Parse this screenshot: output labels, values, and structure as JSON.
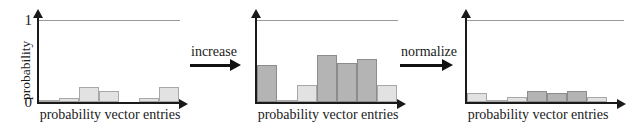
{
  "figure": {
    "title": "",
    "panels": [
      {
        "id": "panel-initial",
        "ylabel": "probability",
        "xlabel": "probability vector entries",
        "yticks": [
          "0",
          "1"
        ],
        "show_ylabel": true,
        "show_yticks": true
      },
      {
        "id": "panel-increased",
        "ylabel": "",
        "xlabel": "probability vector entries",
        "yticks": [],
        "show_ylabel": false,
        "show_yticks": false
      },
      {
        "id": "panel-normalized",
        "ylabel": "",
        "xlabel": "probability vector entries",
        "yticks": [],
        "show_ylabel": false,
        "show_yticks": false
      }
    ],
    "arrows": [
      {
        "id": "arrow-increase",
        "label": "increase"
      },
      {
        "id": "arrow-normalize",
        "label": "normalize"
      }
    ],
    "colors": {
      "bar_light_fill": "#e2e2e2",
      "bar_light_stroke": "#a8a8a8",
      "bar_dark_fill": "#b4b4b4",
      "bar_dark_stroke": "#8c8c8c",
      "axis": "#1a1a1a",
      "guide_line": "#9a9a9a",
      "arrow": "#111111",
      "background": "#ffffff"
    }
  },
  "chart_data": [
    {
      "type": "bar",
      "id": "panel-initial",
      "title": "",
      "xlabel": "probability vector entries",
      "ylabel": "probability",
      "ylim": [
        0,
        1
      ],
      "yticks": [
        0,
        1
      ],
      "ytick_labels": [
        "0",
        "1"
      ],
      "grid": false,
      "guide_line_y": 1,
      "legend": "none",
      "categories": [
        "1",
        "2",
        "3",
        "4",
        "5",
        "6",
        "7"
      ],
      "values": [
        0.03,
        0.05,
        0.18,
        0.13,
        0.0,
        0.05,
        0.18
      ],
      "bar_styles": [
        "light",
        "light",
        "light",
        "light",
        "light",
        "light",
        "light"
      ]
    },
    {
      "type": "bar",
      "id": "panel-increased",
      "title": "",
      "xlabel": "probability vector entries",
      "ylabel": "",
      "ylim": [
        0,
        1
      ],
      "yticks": [],
      "ytick_labels": [],
      "grid": false,
      "guide_line_y": 1,
      "legend": "none",
      "categories": [
        "1",
        "2",
        "3",
        "4",
        "5",
        "6",
        "7"
      ],
      "values": [
        0.45,
        0.03,
        0.21,
        0.57,
        0.48,
        0.52,
        0.21
      ],
      "bar_styles": [
        "dark",
        "light",
        "light",
        "dark",
        "dark",
        "dark",
        "light"
      ]
    },
    {
      "type": "bar",
      "id": "panel-normalized",
      "title": "",
      "xlabel": "probability vector entries",
      "ylabel": "",
      "ylim": [
        0,
        1
      ],
      "yticks": [],
      "ytick_labels": [],
      "grid": false,
      "guide_line_y": 1,
      "legend": "none",
      "categories": [
        "1",
        "2",
        "3",
        "4",
        "5",
        "6",
        "7"
      ],
      "values": [
        0.11,
        0.012,
        0.06,
        0.14,
        0.115,
        0.13,
        0.06
      ],
      "bar_styles": [
        "light",
        "light",
        "light",
        "dark",
        "dark",
        "dark",
        "light"
      ]
    }
  ]
}
